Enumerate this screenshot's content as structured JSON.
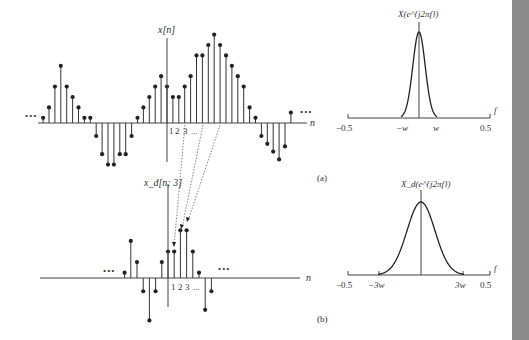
{
  "panel_a": {
    "caption": "(a)",
    "time_plot": {
      "ylabel": "x[n]",
      "xlabel": "n",
      "ellipsis_left": "•••",
      "ellipsis_right": "•••",
      "tick_labels": [
        "1",
        "2",
        "3",
        "..."
      ]
    },
    "freq_plot": {
      "ylabel": "X(e^{j2πf})",
      "xlabel": "f",
      "ticks": [
        "−0.5",
        "−w",
        "w",
        "0.5"
      ]
    }
  },
  "panel_b": {
    "caption": "(b)",
    "time_plot": {
      "ylabel": "x_d[n; 3]",
      "xlabel": "n",
      "ellipsis_left": "•••",
      "ellipsis_right": "•••",
      "tick_labels": [
        "1",
        "2",
        "3",
        "..."
      ]
    },
    "freq_plot": {
      "ylabel": "X_d(e^{j2πf})",
      "xlabel": "f",
      "ticks": [
        "−0.5",
        "−3w",
        "3w",
        "0.5"
      ]
    }
  },
  "chart_data": [
    {
      "type": "stem",
      "title": "x[n]",
      "xlabel": "n",
      "x": [
        -21,
        -20,
        -19,
        -18,
        -17,
        -16,
        -15,
        -14,
        -13,
        -12,
        -11,
        -10,
        -9,
        -8,
        -7,
        -6,
        -5,
        -4,
        -3,
        -2,
        -1,
        0,
        1,
        2,
        3,
        4,
        5,
        6,
        7,
        8,
        9,
        10,
        11,
        12,
        13,
        14,
        15,
        16,
        17,
        18,
        19,
        20,
        21
      ],
      "values": [
        1,
        3,
        7,
        11,
        7,
        5,
        3,
        1,
        1,
        -2.5,
        -6,
        -8,
        -8,
        -6,
        -6,
        -2.5,
        1,
        3,
        5,
        7,
        9,
        7,
        5,
        5,
        7,
        9,
        13,
        13,
        15,
        17,
        15,
        13,
        11,
        9,
        7,
        3,
        1,
        -2.5,
        -4,
        -5.5,
        -7,
        -4.5,
        2
      ]
    },
    {
      "type": "stem",
      "title": "x_d[n; 3] (decimated by 3)",
      "xlabel": "n",
      "x": [
        -7,
        -6,
        -5,
        -4,
        -3,
        -2,
        -1,
        0,
        1,
        2,
        3,
        4,
        5,
        6,
        7
      ],
      "values": [
        1,
        7,
        3,
        -2.5,
        -8,
        -2.5,
        3,
        5,
        5,
        9,
        9,
        5,
        1,
        -6,
        -2.5
      ]
    },
    {
      "type": "line",
      "title": "X(e^{j2πf})",
      "xlabel": "f",
      "xlim": [
        -0.5,
        0.5
      ],
      "xticks": [
        "-0.5",
        "-w",
        "w",
        "0.5"
      ],
      "shape": "narrow bell, bandlimited to [-w, w]"
    },
    {
      "type": "line",
      "title": "X_d(e^{j2πf})",
      "xlabel": "f",
      "xlim": [
        -0.5,
        0.5
      ],
      "xticks": [
        "-0.5",
        "-3w",
        "3w",
        "0.5"
      ],
      "shape": "wider bell (3x stretched), bandlimited to [-3w, 3w]"
    }
  ]
}
